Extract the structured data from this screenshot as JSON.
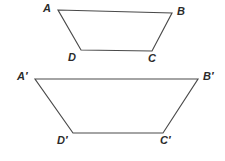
{
  "diagram": {
    "background_color": "#ffffff",
    "stroke_color": "#4a4a4a",
    "label_color": "#2b2b2b",
    "figures": [
      {
        "name": "trapezoid-abcd",
        "points": "58,10 172,13 152,51 81,50",
        "vertices": [
          {
            "label": "A",
            "x": 58,
            "y": 10,
            "label_x": 43,
            "label_y": 3
          },
          {
            "label": "B",
            "x": 172,
            "y": 13,
            "label_x": 177,
            "label_y": 6
          },
          {
            "label": "C",
            "x": 152,
            "y": 51,
            "label_x": 148,
            "label_y": 53
          },
          {
            "label": "D",
            "x": 81,
            "y": 50,
            "label_x": 68,
            "label_y": 52
          }
        ]
      },
      {
        "name": "trapezoid-a-prime-b-prime-c-prime-d-prime",
        "points": "35,79 198,79 163,133 73,133",
        "vertices": [
          {
            "label": "A′",
            "x": 35,
            "y": 79,
            "label_x": 17,
            "label_y": 71
          },
          {
            "label": "B′",
            "x": 198,
            "y": 79,
            "label_x": 203,
            "label_y": 71
          },
          {
            "label": "C′",
            "x": 163,
            "y": 133,
            "label_x": 160,
            "label_y": 135
          },
          {
            "label": "D′",
            "x": 73,
            "y": 133,
            "label_x": 57,
            "label_y": 135
          }
        ]
      }
    ]
  }
}
